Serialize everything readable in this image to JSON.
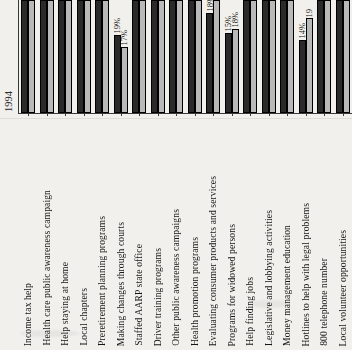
{
  "chart_data": {
    "type": "bar",
    "title": "",
    "xlabel": "",
    "ylabel": "",
    "axis_tick_label": "1994",
    "grid": false,
    "legend_position": "none",
    "note": "Cropped bottom portion of a grayscale paired bar chart; most bars are cut off by the top edge of the crop. Only bars with visible tops carry data labels.",
    "categories": [
      "Income tax help",
      "Health care public awareness campaign",
      "Help staying at home",
      "Local chapters",
      "Preretirement planning programs",
      "Making changes through courts",
      "Staffed AARP state office",
      "Driver training programs",
      "Other public awareness campaigns",
      "Health promotion programs",
      "Evaluating consumer products and services",
      "Programs for widowed persons",
      "Help finding jobs",
      "Legislative and lobbying activities",
      "Money management education",
      "Hotlines to help with legal problems",
      "800 telephone number",
      "Local volunteer opportunities"
    ],
    "series": [
      {
        "name": "series-dark",
        "color": "#2a2a2a",
        "values": [
          null,
          null,
          null,
          null,
          null,
          19,
          null,
          null,
          null,
          null,
          18,
          15,
          null,
          null,
          null,
          14,
          null,
          null
        ],
        "value_labels": [
          "",
          "",
          "",
          "",
          "",
          "19%",
          "",
          "",
          "",
          "",
          "18%",
          "15%",
          "",
          "",
          "",
          "14%",
          "",
          ""
        ]
      },
      {
        "name": "series-light",
        "color": "#b9b9b9",
        "values": [
          null,
          null,
          null,
          null,
          null,
          17,
          null,
          null,
          null,
          null,
          22,
          18,
          null,
          null,
          null,
          19,
          null,
          null
        ],
        "value_labels": [
          "",
          "",
          "",
          "",
          "",
          "17%",
          "",
          "",
          "",
          "",
          "2",
          "18%",
          "",
          "",
          "",
          "19",
          "",
          ""
        ]
      }
    ],
    "bar_pixel_heights_dark": [
      113,
      113,
      113,
      113,
      113,
      78,
      113,
      113,
      113,
      113,
      100,
      80,
      113,
      113,
      113,
      73,
      113,
      113
    ],
    "bar_pixel_heights_light": [
      113,
      113,
      113,
      113,
      113,
      66,
      113,
      113,
      113,
      113,
      113,
      84,
      113,
      113,
      113,
      95,
      113,
      113
    ]
  }
}
